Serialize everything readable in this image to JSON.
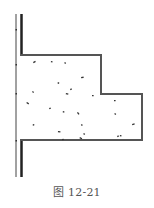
{
  "figure": {
    "caption": "图 12-21",
    "colors": {
      "outline": "#555555",
      "wall_thick": "#222222",
      "wall_thin": "#444444",
      "speckle": "#333333",
      "caption": "#555555",
      "background": "#ffffff"
    },
    "wall": {
      "thin_line_x": 16,
      "thick_line_x": 21.5,
      "top_y": 14,
      "bottom_y": 177,
      "gap_top_y": 55,
      "gap_bottom_y": 140
    },
    "block_outline_points": "21,55 101,55 101,94 142,94 142,140 21,140",
    "speckles": [
      [
        33,
        62
      ],
      [
        51,
        61
      ],
      [
        65,
        62
      ],
      [
        81,
        77
      ],
      [
        58,
        82
      ],
      [
        70,
        89
      ],
      [
        66,
        93
      ],
      [
        33,
        91
      ],
      [
        92,
        95
      ],
      [
        27,
        102
      ],
      [
        49,
        108
      ],
      [
        63,
        111
      ],
      [
        78,
        112
      ],
      [
        114,
        100
      ],
      [
        115,
        113
      ],
      [
        132,
        124
      ],
      [
        33,
        124
      ],
      [
        82,
        124
      ],
      [
        58,
        131
      ],
      [
        84,
        133
      ],
      [
        62,
        139
      ],
      [
        80,
        137
      ],
      [
        117,
        136
      ],
      [
        120,
        135
      ]
    ]
  }
}
